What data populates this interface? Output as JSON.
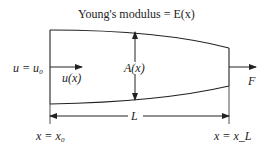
{
  "title": "Young's modulus = E(x)",
  "labels": {
    "left_bc": "u = u₀",
    "displacement": "u(x)",
    "area": "A(x)",
    "force": "F",
    "length": "L",
    "x_start": "x = x₀",
    "x_end": "x = x_L"
  },
  "colors": {
    "line": "#222222",
    "background": "#ffffff"
  }
}
